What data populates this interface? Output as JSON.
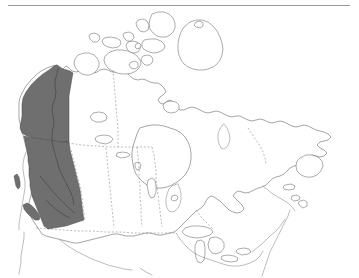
{
  "figure": {
    "background_color": "#ffffff",
    "outline_color": "#5a5a5a",
    "highlight_color": "#6f6f6f",
    "boundary_style": "dotted",
    "boundary_color": "#8d8d8d",
    "rule_color": "#9a9a9a"
  },
  "rule": {
    "label": "horizontal rule"
  },
  "map": {
    "country": "Canada",
    "projection": "conic",
    "highlighted_regions": [
      {
        "id": "yukon",
        "name": "Yukon",
        "shaded": true,
        "fill": "#6f6f6f"
      },
      {
        "id": "british-columbia",
        "name": "British Columbia",
        "shaded": true,
        "fill": "#6f6f6f"
      }
    ],
    "unshaded_regions": [
      {
        "id": "northwest-territories",
        "name": "Northwest Territories",
        "shaded": false
      },
      {
        "id": "nunavut",
        "name": "Nunavut",
        "shaded": false
      },
      {
        "id": "alberta",
        "name": "Alberta",
        "shaded": false
      },
      {
        "id": "saskatchewan",
        "name": "Saskatchewan",
        "shaded": false
      },
      {
        "id": "manitoba",
        "name": "Manitoba",
        "shaded": false
      },
      {
        "id": "ontario",
        "name": "Ontario",
        "shaded": false
      },
      {
        "id": "quebec",
        "name": "Quebec",
        "shaded": false
      },
      {
        "id": "new-brunswick",
        "name": "New Brunswick",
        "shaded": false
      },
      {
        "id": "nova-scotia",
        "name": "Nova Scotia",
        "shaded": false
      },
      {
        "id": "prince-edward-island",
        "name": "Prince Edward Island",
        "shaded": false
      },
      {
        "id": "newfoundland-labrador",
        "name": "Newfoundland and Labrador",
        "shaded": false
      }
    ],
    "water_features": [
      {
        "id": "hudson-bay",
        "name": "Hudson Bay"
      },
      {
        "id": "great-lakes",
        "name": "Great Lakes"
      },
      {
        "id": "great-bear-lake",
        "name": "Great Bear Lake"
      },
      {
        "id": "great-slave-lake",
        "name": "Great Slave Lake"
      },
      {
        "id": "lake-winnipeg",
        "name": "Lake Winnipeg"
      }
    ],
    "legend": []
  }
}
